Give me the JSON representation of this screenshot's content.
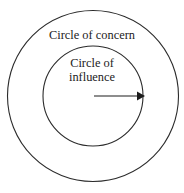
{
  "diagram": {
    "background_color": "#ffffff",
    "stroke_color": "#2b2b2b",
    "text_color": "#222222",
    "outer": {
      "label": "Circle of concern",
      "center_x": 93,
      "center_y": 96,
      "radius": 85.5
    },
    "inner": {
      "label_line1": "Circle of",
      "label_line2": "influence",
      "center_x": 93,
      "center_y": 96,
      "radius": 50
    },
    "arrow": {
      "name": "influence-expansion-arrow",
      "start_x": 94,
      "start_y": 96,
      "end_x": 144,
      "end_y": 96,
      "color": "#1c1c1c"
    }
  }
}
